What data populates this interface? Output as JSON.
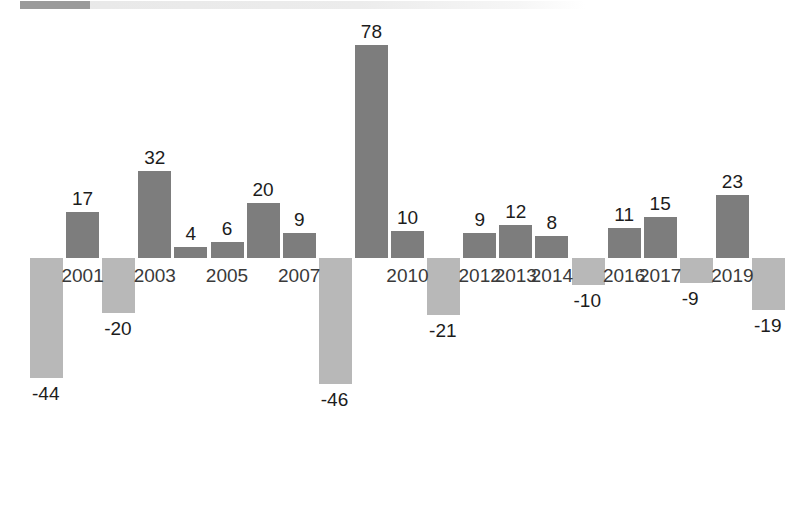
{
  "scrollbar": {
    "name": "horizontal-scrollbar",
    "thumb_label": "",
    "track_label": ""
  },
  "colors": {
    "positive_bar": "#7d7d7d",
    "negative_bar": "#b8b8b8",
    "label_text": "#1c1c1c",
    "axis_label_text": "#3a3a3a",
    "background": "#ffffff",
    "scrollbar_thumb": "#9a9a9a",
    "scrollbar_track": "#ececec"
  },
  "chart_data": {
    "type": "bar",
    "title": "",
    "subtitle": "",
    "xlabel": "",
    "ylabel": "",
    "grid": false,
    "legend": null,
    "ylim": [
      -46,
      78
    ],
    "baseline": 0,
    "categories": [
      "2000",
      "2001",
      "2002",
      "2003",
      "2004",
      "2005",
      "2006",
      "2007",
      "2008",
      "2009",
      "2010",
      "2011",
      "2012",
      "2013",
      "2014",
      "2015",
      "2016",
      "2017",
      "2018",
      "2019",
      "2020"
    ],
    "values": [
      -44,
      17,
      -20,
      32,
      4,
      6,
      20,
      9,
      -46,
      78,
      10,
      -21,
      9,
      12,
      8,
      -10,
      11,
      15,
      -9,
      23,
      -19
    ],
    "value_labels": [
      "-44",
      "17",
      "-20",
      "32",
      "4",
      "6",
      "20",
      "9",
      "-46",
      "78",
      "10",
      "-21",
      "9",
      "12",
      "8",
      "-10",
      "11",
      "15",
      "-9",
      "23",
      "-19"
    ],
    "visible_tick_labels": [
      "2001",
      "2003",
      "2005",
      "2007",
      "2010",
      "2012",
      "2013",
      "2014",
      "2016",
      "2017",
      "2019"
    ],
    "tick_label_indices": [
      1,
      3,
      5,
      7,
      10,
      12,
      13,
      14,
      16,
      17,
      19
    ]
  }
}
